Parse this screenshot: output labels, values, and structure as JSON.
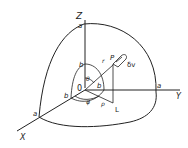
{
  "diagram": {
    "type": "3d-spherical-coordinates",
    "axes": {
      "z": "Z",
      "y": "Y",
      "x": "X"
    },
    "origin": "0",
    "labels": {
      "outer_radius_z": "a",
      "outer_radius_y": "a",
      "outer_radius_x": "a",
      "inner_radius_z": "b",
      "inner_radius_y": "b",
      "inner_radius_x": "b",
      "point": "P",
      "radius": "r",
      "polar_angle": "θ",
      "azimuth_angle": "φ",
      "projection_radius": "ρ",
      "projection_point": "L",
      "volume_element": "δv"
    },
    "colors": {
      "stroke": "#222222",
      "background": "#ffffff"
    }
  }
}
